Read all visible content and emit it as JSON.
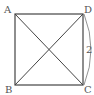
{
  "diagram": {
    "type": "square-with-diagonals",
    "vertices": {
      "A": {
        "label": "A",
        "x": 15,
        "y": 14
      },
      "B": {
        "label": "B",
        "x": 15,
        "y": 85
      },
      "C": {
        "label": "C",
        "x": 83,
        "y": 85
      },
      "D": {
        "label": "D",
        "x": 83,
        "y": 14
      }
    },
    "side_label": {
      "side": "DC",
      "text": "2"
    },
    "line_color": "#444444",
    "label_color": "#555555"
  }
}
